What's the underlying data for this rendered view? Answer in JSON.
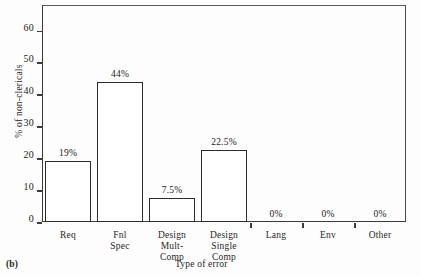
{
  "figure": {
    "caption": "(b)",
    "xlabel": "Type of error",
    "ylabel": "% of non-clericals"
  },
  "chart_data": {
    "type": "bar",
    "title": "",
    "xlabel": "Type of error",
    "ylabel": "% of non-clericals",
    "categories": [
      "Req",
      "Fnl\nSpec",
      "Design\nMult-\nComp",
      "Design\nSingle\nComp",
      "Lang",
      "Env",
      "Other"
    ],
    "values": [
      19,
      44,
      7.5,
      22.5,
      0,
      0,
      0
    ],
    "data_labels": [
      "19%",
      "44%",
      "7.5%",
      "22.5%",
      "0%",
      "0%",
      "0%"
    ],
    "ylim": [
      0,
      68
    ],
    "yticks": [
      0,
      10,
      20,
      30,
      40,
      50,
      60
    ],
    "ytick_labels": [
      "0",
      "10",
      "20",
      "30",
      "40",
      "50",
      "60"
    ],
    "grid": false,
    "legend": false,
    "bar_fill": "#ffffff",
    "bar_edge": "#2b2b2b"
  }
}
